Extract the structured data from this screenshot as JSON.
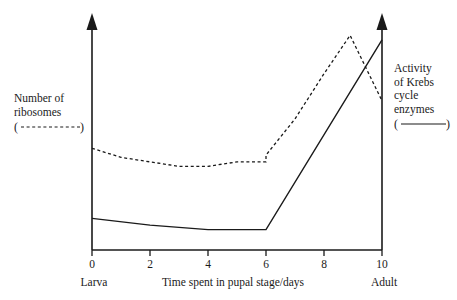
{
  "chart_data": {
    "type": "line",
    "title": "",
    "xlabel": "Time spent in pupal stage/days",
    "ylabel_left": "Number of ribosomes",
    "ylabel_right": "Activity of Krebs cycle enzymes",
    "xlim": [
      0,
      10
    ],
    "xticks": [
      0,
      2,
      4,
      6,
      8,
      10
    ],
    "xticklabels": [
      "0",
      "2",
      "4",
      "6",
      "8",
      "10"
    ],
    "ylim_left": [
      0,
      100
    ],
    "ylim_right": [
      0,
      100
    ],
    "yticks": [],
    "grid": false,
    "stage_start": "Larva",
    "stage_end": "Adult",
    "series": [
      {
        "name": "Number of ribosomes",
        "style": "dashed",
        "axis": "left",
        "color": "#1a1a1a",
        "x": [
          0,
          1,
          2,
          3,
          4,
          5,
          6,
          6,
          7,
          8,
          8.9,
          10
        ],
        "values": [
          45,
          41,
          39,
          37,
          37,
          39,
          39,
          42,
          58,
          78,
          95,
          66
        ]
      },
      {
        "name": "Activity of Krebs cycle enzymes",
        "style": "solid",
        "axis": "right",
        "color": "#1a1a1a",
        "x": [
          0,
          2,
          4,
          6,
          10
        ],
        "values": [
          14,
          11,
          9,
          9,
          93
        ]
      }
    ]
  },
  "legend": {
    "left": {
      "line1": "Number of",
      "line2": "ribosomes",
      "key": "dashed-line-key"
    },
    "right": {
      "line1": "Activity",
      "line2": "of Krebs",
      "line3": "cycle",
      "line4": "enzymes",
      "key": "solid-line-key"
    }
  },
  "axis": {
    "x_title": "Time spent in pupal stage/days",
    "tick_0": "0",
    "tick_2": "2",
    "tick_4": "4",
    "tick_6": "6",
    "tick_8": "8",
    "tick_10": "10",
    "stage_left": "Larva",
    "stage_right": "Adult"
  },
  "colors": {
    "ink": "#1a1a1a",
    "background": "#ffffff"
  }
}
